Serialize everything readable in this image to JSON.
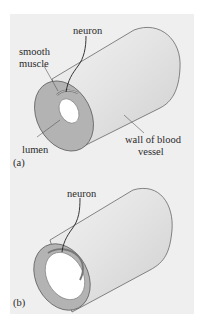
{
  "figure": {
    "panel_a": {
      "tag": "(a)",
      "labels": {
        "neuron": "neuron",
        "smooth_muscle_line1": "smooth",
        "smooth_muscle_line2": "muscle",
        "lumen": "lumen",
        "wall_line1": "wall of blood",
        "wall_line2": "vessel"
      }
    },
    "panel_b": {
      "tag": "(b)",
      "labels": {
        "neuron": "neuron"
      }
    },
    "colors": {
      "background": "#efefef",
      "cylinder_body": "#e2e2e2",
      "wall_cross_section": "#b3b3b3",
      "lumen": "#ffffff",
      "outline": "#555555"
    }
  }
}
